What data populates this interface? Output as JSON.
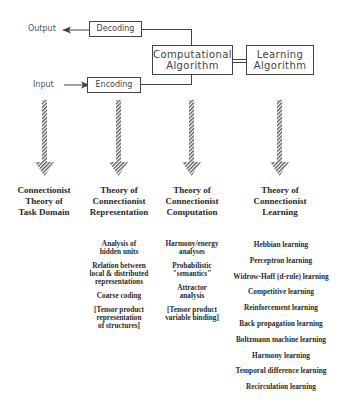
{
  "top": {
    "output_label": "Output",
    "input_label": "Input",
    "decoding_box": "Decoding",
    "encoding_box": "Encoding",
    "computational_box": [
      "Computational",
      "Algorithm"
    ],
    "learning_box": [
      "Learning",
      "Algorithm"
    ]
  },
  "columns": [
    {
      "title": [
        "Connectionist",
        "Theory of",
        "Task Domain"
      ],
      "items": []
    },
    {
      "title": [
        "Theory of",
        "Connectionist",
        "Representation"
      ],
      "items": [
        "Analysis of\nhidden units",
        "Relation between\nlocal & distributed\nrepresentations",
        "Coarse coding",
        "[Tensor product\nrepresentation\nof structures]"
      ]
    },
    {
      "title": [
        "Theory of",
        "Connectionist",
        "Computation"
      ],
      "items": [
        "Harmony/energy\nanalyses",
        "Probabilistic\n\"semantics\"",
        "Attractor\nanalysis",
        "[Tensor product\nvariable binding]"
      ]
    },
    {
      "title": [
        "Theory of",
        "Connectionist",
        "Learning"
      ],
      "items": [
        "Hebbian learning",
        "Perceptron learning",
        "Widrow-Hoff (d-rule) learning",
        "Competitive learning",
        "Reinforcement learning",
        "Back propagation learning",
        "Boltzmann machine learning",
        "Harmony learning",
        "Temporal difference learning",
        "Recirculation learning"
      ]
    }
  ],
  "colors": {
    "line": "#444444",
    "text": "#2a2a2a",
    "background": "#ffffff"
  }
}
